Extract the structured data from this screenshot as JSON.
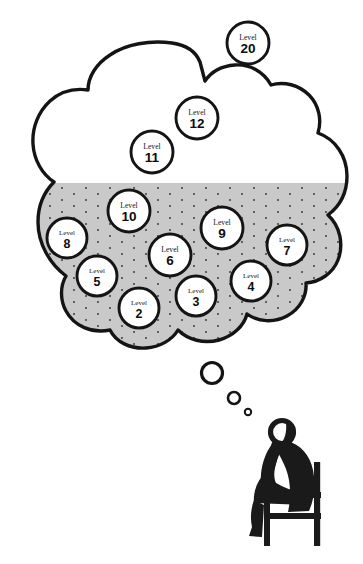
{
  "figure": {
    "type": "illustration",
    "colors": {
      "outline": "#141414",
      "cloud_fill_top": "#ffffff",
      "cloud_fill_bottom": "#c9c9c9",
      "stipple_dot": "#3a3a3a",
      "badge_fill": "#ffffff",
      "badge_stroke": "#141414",
      "figure_fill": "#1a1a1a",
      "page_background": "#ffffff"
    }
  },
  "badges": {
    "label_word": "Level",
    "items": [
      {
        "id": "level-20",
        "word": "Level",
        "number": "20",
        "cx": 248,
        "cy": 43,
        "r": 21,
        "zone": "white"
      },
      {
        "id": "level-12",
        "word": "Level",
        "number": "12",
        "cx": 197,
        "cy": 118,
        "r": 21,
        "zone": "white"
      },
      {
        "id": "level-11",
        "word": "Level",
        "number": "11",
        "cx": 152,
        "cy": 152,
        "r": 21,
        "zone": "white"
      },
      {
        "id": "level-10",
        "word": "Level",
        "number": "10",
        "cx": 129,
        "cy": 211,
        "r": 21,
        "zone": "gray"
      },
      {
        "id": "level-9",
        "word": "Level",
        "number": "9",
        "cx": 222,
        "cy": 228,
        "r": 21,
        "zone": "gray"
      },
      {
        "id": "level-8",
        "word": "Level",
        "number": "8",
        "cx": 67,
        "cy": 238,
        "r": 20,
        "zone": "gray"
      },
      {
        "id": "level-7",
        "word": "Level",
        "number": "7",
        "cx": 287,
        "cy": 245,
        "r": 20,
        "zone": "gray"
      },
      {
        "id": "level-6",
        "word": "Level",
        "number": "6",
        "cx": 170,
        "cy": 255,
        "r": 21,
        "zone": "gray"
      },
      {
        "id": "level-5",
        "word": "Level",
        "number": "5",
        "cx": 97,
        "cy": 276,
        "r": 20,
        "zone": "gray"
      },
      {
        "id": "level-4",
        "word": "Level",
        "number": "4",
        "cx": 251,
        "cy": 281,
        "r": 20,
        "zone": "gray"
      },
      {
        "id": "level-3",
        "word": "Level",
        "number": "3",
        "cx": 196,
        "cy": 296,
        "r": 20,
        "zone": "gray"
      },
      {
        "id": "level-2",
        "word": "Level",
        "number": "2",
        "cx": 139,
        "cy": 308,
        "r": 20,
        "zone": "gray"
      }
    ]
  },
  "thought_trail": {
    "bubbles": [
      {
        "id": "bubble-large",
        "cx": 212,
        "cy": 373,
        "r": 10.5,
        "stroke": 3.2
      },
      {
        "id": "bubble-medium",
        "cx": 234,
        "cy": 398,
        "r": 6.0,
        "stroke": 2.6
      },
      {
        "id": "bubble-small",
        "cx": 248,
        "cy": 412,
        "r": 3.2,
        "stroke": 2.0
      }
    ]
  },
  "thinker": {
    "name": "seated-thinking-figure",
    "parts": [
      "head",
      "arm",
      "torso",
      "leg",
      "foot",
      "chair"
    ]
  }
}
